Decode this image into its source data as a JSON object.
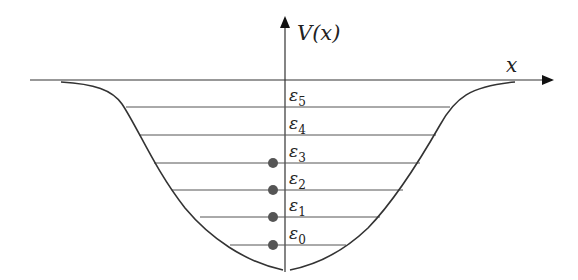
{
  "diagram": {
    "axes": {
      "y_label": "V(x)",
      "x_label": "x"
    },
    "energy_levels": [
      {
        "symbol": "ε",
        "index": "0",
        "occupied": true
      },
      {
        "symbol": "ε",
        "index": "1",
        "occupied": true
      },
      {
        "symbol": "ε",
        "index": "2",
        "occupied": true
      },
      {
        "symbol": "ε",
        "index": "3",
        "occupied": true
      },
      {
        "symbol": "ε",
        "index": "4",
        "occupied": false
      },
      {
        "symbol": "ε",
        "index": "5",
        "occupied": false
      }
    ],
    "colors": {
      "line": "#333333",
      "level_line": "#555555",
      "particle": "#555555"
    }
  }
}
